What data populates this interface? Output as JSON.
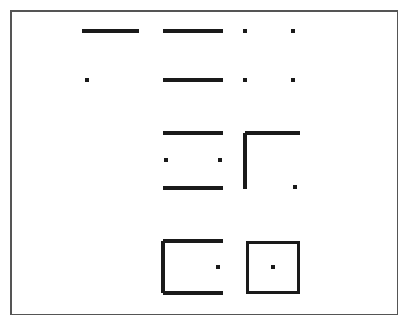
{
  "figure": {
    "canvas": {
      "width": 409,
      "height": 326
    },
    "background_color": "#ffffff",
    "ink_color": "#1a1a1a",
    "border": {
      "name": "figure-frame",
      "x": 10,
      "y": 10,
      "width": 388,
      "height": 305,
      "stroke_width": 1.5,
      "color": "#555555",
      "fill": "#ffffff"
    },
    "stroke_width": 3.2,
    "dot_radius": 2.4,
    "columns_x": [
      110,
      193,
      245,
      293
    ],
    "rows_y": [
      31,
      80,
      160,
      267
    ],
    "elements": [
      {
        "name": "row1-col1-horizontal-line",
        "shape": "line",
        "x1": 82,
        "y1": 31,
        "x2": 139,
        "y2": 31
      },
      {
        "name": "row1-col2-horizontal-line",
        "shape": "line",
        "x1": 163,
        "y1": 31,
        "x2": 223,
        "y2": 31
      },
      {
        "name": "row1-col3-dot",
        "shape": "dot",
        "cx": 245,
        "cy": 31
      },
      {
        "name": "row1-col4-dot",
        "shape": "dot",
        "cx": 293,
        "cy": 31
      },
      {
        "name": "row2-col1-dot",
        "shape": "dot",
        "cx": 87,
        "cy": 80
      },
      {
        "name": "row2-col2-horizontal-line",
        "shape": "line",
        "x1": 163,
        "y1": 80,
        "x2": 223,
        "y2": 80
      },
      {
        "name": "row2-col3-dot",
        "shape": "dot",
        "cx": 245,
        "cy": 80
      },
      {
        "name": "row2-col4-dot",
        "shape": "dot",
        "cx": 293,
        "cy": 80
      },
      {
        "name": "row3-col2-top-horizontal-line",
        "shape": "line",
        "x1": 163,
        "y1": 133,
        "x2": 223,
        "y2": 133
      },
      {
        "name": "row3-col2-left-dot",
        "shape": "dot",
        "cx": 166,
        "cy": 160
      },
      {
        "name": "row3-col2-right-dot",
        "shape": "dot",
        "cx": 220,
        "cy": 160
      },
      {
        "name": "row3-col2-bottom-horizontal-line",
        "shape": "line",
        "x1": 163,
        "y1": 188,
        "x2": 223,
        "y2": 188
      },
      {
        "name": "row3-col3-corner-top-line",
        "shape": "line",
        "x1": 245,
        "y1": 133,
        "x2": 300,
        "y2": 133
      },
      {
        "name": "row3-col3-corner-left-line",
        "shape": "line",
        "x1": 245,
        "y1": 133,
        "x2": 245,
        "y2": 189
      },
      {
        "name": "row3-col4-dot",
        "shape": "dot",
        "cx": 295,
        "cy": 187
      },
      {
        "name": "row4-col2-open-square-top-line",
        "shape": "line",
        "x1": 163,
        "y1": 241,
        "x2": 223,
        "y2": 241
      },
      {
        "name": "row4-col2-open-square-left-line",
        "shape": "line",
        "x1": 163,
        "y1": 241,
        "x2": 163,
        "y2": 293
      },
      {
        "name": "row4-col2-open-square-bottom-line",
        "shape": "line",
        "x1": 163,
        "y1": 293,
        "x2": 223,
        "y2": 293
      },
      {
        "name": "row4-col2-dot",
        "shape": "dot",
        "cx": 218,
        "cy": 267
      },
      {
        "name": "row4-col3-closed-square",
        "shape": "rect",
        "x": 246,
        "y": 241,
        "width": 54,
        "height": 53
      },
      {
        "name": "row4-col3-center-dot",
        "shape": "dot",
        "cx": 273,
        "cy": 267
      }
    ]
  }
}
